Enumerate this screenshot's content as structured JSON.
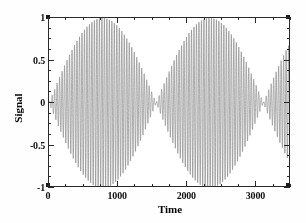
{
  "chart_data": {
    "type": "line",
    "title": "",
    "xlabel": "Time",
    "ylabel": "Signal",
    "xlim": [
      0,
      3500
    ],
    "ylim": [
      -1,
      1
    ],
    "grid": false,
    "legend": "none",
    "xticks": [
      0,
      1000,
      2000,
      3000
    ],
    "xtick_labels": [
      "0",
      "1000",
      "2000",
      "3000"
    ],
    "yticks": [
      -1,
      -0.5,
      0,
      0.5,
      1
    ],
    "ytick_labels": [
      "-1",
      "-0.5",
      "0",
      "0.5",
      "1"
    ],
    "x_minor_tick_interval": 250,
    "y_minor_tick_interval": 0.125,
    "trace_color": "#8a8a8a",
    "axis_color": "#2a2a2a",
    "series": [
      {
        "name": "Signal",
        "carrier_period": 36,
        "envelope_period": 1600,
        "envelope_nodes": [
          0,
          1550,
          3150
        ],
        "envelope_antinodes": [
          750,
          2350
        ],
        "amplitude_max": 1,
        "envelope_samples": {
          "x": [
            0,
            100,
            200,
            300,
            400,
            500,
            600,
            700,
            750,
            800,
            900,
            1000,
            1100,
            1200,
            1300,
            1400,
            1500,
            1550,
            1600,
            1700,
            1800,
            1900,
            2000,
            2100,
            2200,
            2300,
            2350,
            2400,
            2500,
            2600,
            2700,
            2800,
            2900,
            3000,
            3100,
            3150,
            3200,
            3300,
            3400,
            3500
          ],
          "y": [
            0.02,
            0.15,
            0.29,
            0.42,
            0.55,
            0.68,
            0.82,
            0.97,
            1.0,
            0.98,
            0.86,
            0.74,
            0.62,
            0.49,
            0.36,
            0.23,
            0.08,
            0.01,
            0.08,
            0.21,
            0.34,
            0.48,
            0.61,
            0.74,
            0.87,
            0.98,
            1.0,
            0.97,
            0.85,
            0.72,
            0.59,
            0.46,
            0.33,
            0.19,
            0.05,
            0.01,
            0.06,
            0.29,
            0.51,
            0.7
          ]
        }
      }
    ]
  },
  "axes": {
    "x_title": "Time",
    "y_title": "Signal"
  }
}
